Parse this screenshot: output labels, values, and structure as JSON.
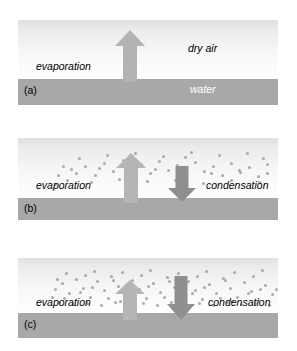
{
  "figure": {
    "colors": {
      "water_band": "#a8a8a8",
      "sky_top": "#e0e0e0",
      "sky_bottom": "#ffffff",
      "arrow_up": "#b3b3b3",
      "arrow_down": "#8f8f8f",
      "vapor_dot": "#a9a9a9",
      "background": "#ffffff"
    }
  },
  "panels": [
    {
      "tag": "(a)",
      "labels": {
        "evaporation": "evaporation",
        "air": "dry air",
        "water": "water"
      },
      "arrows": {
        "up": {
          "label": "evaporation",
          "relative_size": "large"
        },
        "down": null
      },
      "vapor_dots": []
    },
    {
      "tag": "(b)",
      "labels": {
        "evaporation": "evaporation",
        "condensation": "condensation"
      },
      "arrows": {
        "up": {
          "label": "evaporation",
          "relative_size": "large"
        },
        "down": {
          "label": "condensation",
          "relative_size": "small"
        }
      },
      "vapor_dots": [
        [
          57,
          34
        ],
        [
          66,
          27
        ],
        [
          76,
          36
        ],
        [
          85,
          24
        ],
        [
          94,
          32
        ],
        [
          48,
          41
        ],
        [
          39,
          36
        ],
        [
          104,
          21
        ],
        [
          113,
          30
        ],
        [
          122,
          25
        ],
        [
          131,
          34
        ],
        [
          140,
          22
        ],
        [
          149,
          31
        ],
        [
          158,
          26
        ],
        [
          167,
          35
        ],
        [
          176,
          23
        ],
        [
          185,
          32
        ],
        [
          194,
          27
        ],
        [
          203,
          36
        ],
        [
          212,
          24
        ],
        [
          221,
          33
        ],
        [
          230,
          28
        ],
        [
          239,
          37
        ],
        [
          248,
          25
        ],
        [
          166,
          18
        ],
        [
          60,
          19
        ],
        [
          88,
          16
        ],
        [
          116,
          14
        ],
        [
          144,
          17
        ],
        [
          172,
          13
        ],
        [
          200,
          16
        ],
        [
          228,
          14
        ],
        [
          44,
          27
        ],
        [
          72,
          43
        ],
        [
          100,
          40
        ],
        [
          128,
          42
        ],
        [
          156,
          41
        ],
        [
          184,
          44
        ],
        [
          212,
          41
        ],
        [
          240,
          43
        ],
        [
          52,
          30
        ],
        [
          80,
          29
        ],
        [
          108,
          33
        ],
        [
          136,
          30
        ],
        [
          164,
          30
        ],
        [
          192,
          34
        ],
        [
          220,
          31
        ],
        [
          248,
          34
        ],
        [
          36,
          45
        ],
        [
          244,
          19
        ]
      ]
    },
    {
      "tag": "(c)",
      "labels": {
        "evaporation": "evaporation",
        "condensation": "condensation"
      },
      "arrows": {
        "up": {
          "label": "evaporation",
          "relative_size": "large"
        },
        "down": {
          "label": "condensation",
          "relative_size": "large"
        }
      },
      "vapor_dots": [
        [
          36,
          30
        ],
        [
          43,
          24
        ],
        [
          50,
          34
        ],
        [
          57,
          20
        ],
        [
          64,
          29
        ],
        [
          71,
          38
        ],
        [
          78,
          22
        ],
        [
          85,
          31
        ],
        [
          92,
          17
        ],
        [
          99,
          27
        ],
        [
          106,
          36
        ],
        [
          113,
          21
        ],
        [
          120,
          30
        ],
        [
          127,
          39
        ],
        [
          134,
          24
        ],
        [
          141,
          33
        ],
        [
          148,
          18
        ],
        [
          155,
          28
        ],
        [
          162,
          37
        ],
        [
          169,
          22
        ],
        [
          176,
          31
        ],
        [
          183,
          40
        ],
        [
          190,
          25
        ],
        [
          197,
          34
        ],
        [
          204,
          19
        ],
        [
          211,
          29
        ],
        [
          218,
          38
        ],
        [
          225,
          23
        ],
        [
          232,
          32
        ],
        [
          239,
          41
        ],
        [
          246,
          26
        ],
        [
          253,
          35
        ],
        [
          40,
          43
        ],
        [
          54,
          45
        ],
        [
          68,
          44
        ],
        [
          82,
          46
        ],
        [
          96,
          43
        ],
        [
          110,
          45
        ],
        [
          124,
          44
        ],
        [
          138,
          46
        ],
        [
          152,
          43
        ],
        [
          166,
          45
        ],
        [
          180,
          44
        ],
        [
          194,
          46
        ],
        [
          208,
          43
        ],
        [
          222,
          45
        ],
        [
          236,
          44
        ],
        [
          250,
          46
        ],
        [
          47,
          14
        ],
        [
          75,
          12
        ],
        [
          103,
          13
        ],
        [
          131,
          11
        ],
        [
          159,
          14
        ],
        [
          187,
          12
        ],
        [
          215,
          13
        ],
        [
          243,
          11
        ],
        [
          33,
          38
        ],
        [
          61,
          33
        ],
        [
          89,
          39
        ],
        [
          117,
          33
        ],
        [
          145,
          38
        ],
        [
          173,
          34
        ],
        [
          201,
          39
        ],
        [
          229,
          34
        ],
        [
          257,
          30
        ],
        [
          38,
          20
        ],
        [
          66,
          16
        ],
        [
          94,
          21
        ],
        [
          122,
          16
        ],
        [
          150,
          22
        ],
        [
          178,
          17
        ],
        [
          206,
          21
        ],
        [
          234,
          17
        ],
        [
          45,
          39
        ],
        [
          73,
          28
        ],
        [
          101,
          42
        ],
        [
          129,
          27
        ],
        [
          157,
          42
        ],
        [
          185,
          28
        ],
        [
          213,
          42
        ],
        [
          241,
          30
        ]
      ]
    }
  ]
}
